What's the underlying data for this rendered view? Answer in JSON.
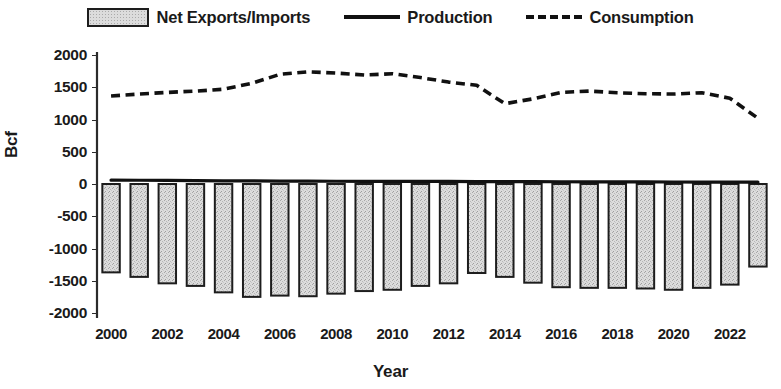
{
  "legend": {
    "items": [
      {
        "label": "Net Exports/Imports",
        "marker": "bar-swatch-icon"
      },
      {
        "label": "Production",
        "marker": "solid-line-icon"
      },
      {
        "label": "Consumption",
        "marker": "dashed-line-icon"
      }
    ]
  },
  "axes": {
    "ylabel": "Bcf",
    "xlabel": "Year",
    "yticks": [
      "2000",
      "1500",
      "1000",
      "500",
      "0",
      "-500",
      "-1000",
      "-1500",
      "-2000"
    ],
    "xticks": [
      "2000",
      "2002",
      "2004",
      "2006",
      "2008",
      "2010",
      "2012",
      "2014",
      "2016",
      "2018",
      "2020",
      "2022"
    ]
  },
  "colors": {
    "axis": "#2b2b2b",
    "line": "#111111",
    "bar_fill": "#dcdcdc",
    "bar_border": "#1d1d1d",
    "text": "#1a1a1a"
  },
  "chart_data": {
    "type": "bar",
    "title": "",
    "xlabel": "Year",
    "ylabel": "Bcf",
    "ylim": [
      -2000,
      2000
    ],
    "ytick_step": 500,
    "grid": false,
    "legend_position": "top",
    "x": [
      2000,
      2001,
      2002,
      2003,
      2004,
      2005,
      2006,
      2007,
      2008,
      2009,
      2010,
      2011,
      2012,
      2013,
      2014,
      2015,
      2016,
      2017,
      2018,
      2019,
      2020,
      2021,
      2022,
      2023
    ],
    "categories": [
      "2000",
      "2001",
      "2002",
      "2003",
      "2004",
      "2005",
      "2006",
      "2007",
      "2008",
      "2009",
      "2010",
      "2011",
      "2012",
      "2013",
      "2014",
      "2015",
      "2016",
      "2017",
      "2018",
      "2019",
      "2020",
      "2021",
      "2022",
      "2023"
    ],
    "series": [
      {
        "name": "Net Exports/Imports",
        "type": "bar",
        "values": [
          -1370,
          -1440,
          -1540,
          -1580,
          -1680,
          -1750,
          -1730,
          -1740,
          -1700,
          -1660,
          -1640,
          -1580,
          -1540,
          -1380,
          -1440,
          -1530,
          -1600,
          -1610,
          -1610,
          -1620,
          -1640,
          -1610,
          -1560,
          -1280
        ]
      },
      {
        "name": "Production",
        "type": "line",
        "style": "solid",
        "values": [
          60,
          58,
          55,
          52,
          50,
          48,
          45,
          44,
          43,
          42,
          42,
          40,
          40,
          38,
          38,
          36,
          35,
          34,
          33,
          32,
          31,
          30,
          30,
          28
        ]
      },
      {
        "name": "Consumption",
        "type": "line",
        "style": "dashed",
        "values": [
          1365,
          1395,
          1420,
          1440,
          1470,
          1560,
          1700,
          1740,
          1720,
          1690,
          1710,
          1650,
          1580,
          1530,
          1245,
          1320,
          1420,
          1440,
          1415,
          1400,
          1395,
          1415,
          1330,
          1020
        ]
      }
    ]
  }
}
